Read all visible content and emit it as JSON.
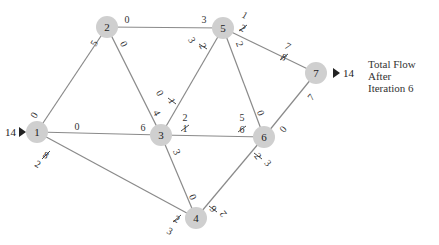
{
  "caption": {
    "line1": "Total Flow",
    "line2": "After",
    "line3": "Iteration 6"
  },
  "source": {
    "node": "1",
    "inflow": "14"
  },
  "sink": {
    "node": "7",
    "outflow": "14"
  },
  "nodes": [
    {
      "id": "1",
      "x": 37,
      "y": 132
    },
    {
      "id": "2",
      "x": 107,
      "y": 27
    },
    {
      "id": "3",
      "x": 161,
      "y": 135
    },
    {
      "id": "4",
      "x": 196,
      "y": 218
    },
    {
      "id": "5",
      "x": 223,
      "y": 28
    },
    {
      "id": "6",
      "x": 264,
      "y": 137
    },
    {
      "id": "7",
      "x": 316,
      "y": 73
    }
  ],
  "edges": [
    {
      "from": "1",
      "to": "2",
      "near_from": {
        "current": "0"
      },
      "near_to": {
        "current": "5"
      }
    },
    {
      "from": "1",
      "to": "3",
      "near_from": {
        "current": "0"
      },
      "near_to": {
        "current": "6"
      }
    },
    {
      "from": "1",
      "to": "4",
      "near_from": {
        "struck": "8",
        "current": "2"
      },
      "near_to": {
        "struck": "2",
        "current": "3"
      }
    },
    {
      "from": "2",
      "to": "3",
      "near_from": {
        "current": "0"
      },
      "near_to": {
        "current": "4"
      }
    },
    {
      "from": "2",
      "to": "5",
      "near_from": {
        "current": "0"
      },
      "near_to": {
        "current": "3"
      }
    },
    {
      "from": "3",
      "to": "4",
      "near_from": {
        "current": "3"
      },
      "near_to": {
        "current": "0"
      }
    },
    {
      "from": "3",
      "to": "5",
      "near_from": {
        "current": "0",
        "struck": "1"
      },
      "near_to": {
        "current": "3",
        "struck": "2"
      }
    },
    {
      "from": "3",
      "to": "6",
      "near_from": {
        "current": "2",
        "struck": "1"
      },
      "near_to": {
        "current": "5",
        "struck": "6"
      }
    },
    {
      "from": "4",
      "to": "6",
      "near_from": {
        "struck": "6",
        "current": "2"
      },
      "near_to": {
        "struck": "2",
        "current": "3"
      }
    },
    {
      "from": "5",
      "to": "6",
      "near_from": {
        "current": "2"
      },
      "near_to": {
        "current": "0"
      }
    },
    {
      "from": "5",
      "to": "7",
      "near_from": {
        "current": "1",
        "struck": "2"
      },
      "near_to": {
        "current": "7",
        "struck": "8"
      }
    },
    {
      "from": "6",
      "to": "7",
      "near_from": {
        "current": "0"
      },
      "near_to": {
        "current": "7"
      }
    }
  ],
  "colors": {
    "node_fill": "#cfcfcf",
    "edge": "#8a8a8a",
    "text": "#333333"
  }
}
